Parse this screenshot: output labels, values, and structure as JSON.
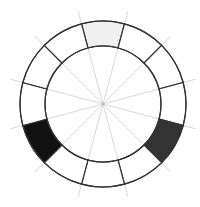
{
  "diagram": {
    "type": "segmented-ring",
    "center": [
      103,
      104
    ],
    "outer_radius": 83,
    "inner_radius": 58,
    "guide_radius": 96,
    "segment_count": 12,
    "segment_offset_deg": -15,
    "stroke_color": "#333333",
    "guide_color": "#d8d8d8",
    "segments": [
      {
        "index": 0,
        "fill": "#f0f0f0"
      },
      {
        "index": 1,
        "fill": "#ffffff"
      },
      {
        "index": 2,
        "fill": "#ffffff"
      },
      {
        "index": 3,
        "fill": "#ffffff"
      },
      {
        "index": 4,
        "fill": "#333333"
      },
      {
        "index": 5,
        "fill": "#ffffff"
      },
      {
        "index": 6,
        "fill": "#ffffff"
      },
      {
        "index": 7,
        "fill": "#ffffff"
      },
      {
        "index": 8,
        "fill": "#111111"
      },
      {
        "index": 9,
        "fill": "#ffffff"
      },
      {
        "index": 10,
        "fill": "#ffffff"
      },
      {
        "index": 11,
        "fill": "#ffffff"
      }
    ]
  }
}
